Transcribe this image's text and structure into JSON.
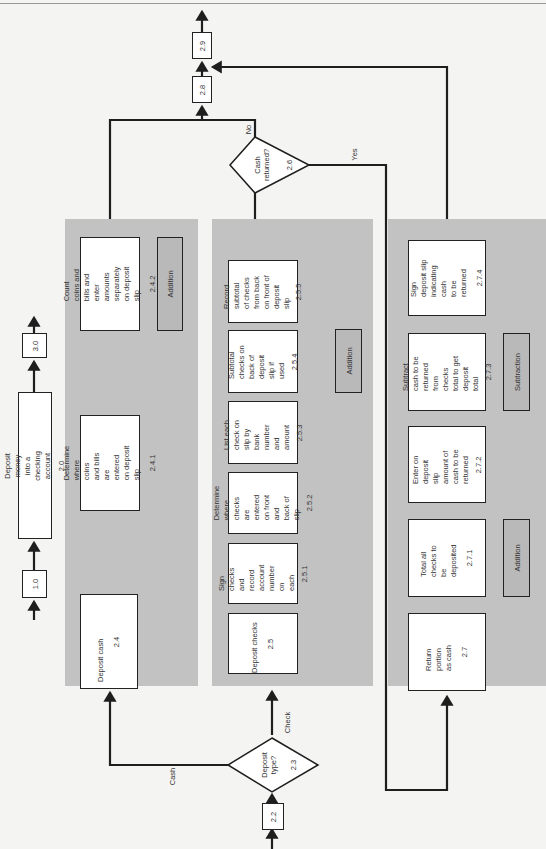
{
  "diagram": {
    "title": "Deposit money into a checking account",
    "orientation": "rotated-90-ccw",
    "context": {
      "prev": "1.0",
      "current": {
        "label": "Deposit money into a checking account",
        "num": "2.0"
      },
      "next": "3.0"
    },
    "start": {
      "num": "2.2"
    },
    "decision_deposit_type": {
      "label": "Deposit\ntype?",
      "num": "2.3",
      "branch_cash": "Cash",
      "branch_check": "Check"
    },
    "cash_column": {
      "steps": [
        {
          "label": "Deposit cash",
          "num": "2.4"
        },
        {
          "label": "Determine where coins\nand bills are entered\non deposit slip",
          "num": "2.4.1"
        },
        {
          "label": "Count coins and bills and\nenter amounts separately\non deposit slip",
          "num": "2.4.2"
        }
      ],
      "helper": "Addition"
    },
    "check_column": {
      "steps": [
        {
          "label": "Deposit checks",
          "num": "2.5"
        },
        {
          "label": "Sign checks\nand record\naccount\nnumber on\neach",
          "num": "2.5.1"
        },
        {
          "label": "Determine\nwhere checks\nare entered\non front and\nback of slip",
          "num": "2.5.2"
        },
        {
          "label": "List each\ncheck on\nslip by\nbank number\nand amount",
          "num": "2.5.3"
        },
        {
          "label": "Subtotal\nchecks on\nback of\ndeposit\nslip if used",
          "num": "2.5.4"
        },
        {
          "label": "Record\nsubtotal\nof checks\nfrom back\non front of\ndeposit slip",
          "num": "2.5.5"
        }
      ],
      "helper": "Addition"
    },
    "decision_cash_returned": {
      "label": "Cash\nreturned?",
      "num": "2.6",
      "branch_no": "No",
      "branch_yes": "Yes"
    },
    "return_column": {
      "steps": [
        {
          "label": "Return portion\nas cash",
          "num": "2.7"
        },
        {
          "label": "Total all\nchecks to be\ndeposited",
          "num": "2.7.1"
        },
        {
          "label": "Enter on deposit\nslip amount of\ncash to be\nreturned",
          "num": "2.7.2"
        },
        {
          "label": "Subtract cash to be\nreturned from checks\ntotal to get deposit\ntotal",
          "num": "2.7.3"
        },
        {
          "label": "Sign deposit slip\nindicating cash\nto be returned",
          "num": "2.7.4"
        }
      ],
      "helper_addition": "Addition",
      "helper_subtraction": "Subtraction"
    },
    "end": [
      {
        "num": "2.8"
      },
      {
        "num": "2.9"
      }
    ],
    "colors": {
      "panel": "#c2c2c2",
      "box": "#ffffff",
      "helper_box": "#b9b9b9",
      "line": "#1e1e1e",
      "background": "#f4f4f2"
    }
  }
}
